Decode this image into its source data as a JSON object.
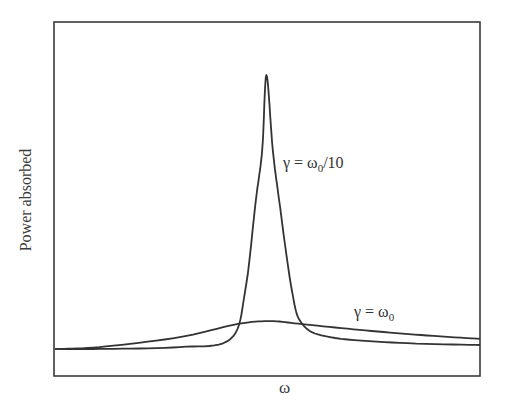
{
  "chart_data": {
    "type": "line",
    "title": "",
    "xlabel": "ω",
    "ylabel": "Power absorbed",
    "grid": false,
    "legend": "none",
    "axis_ticks": "none",
    "x_note": "ω in units of ω0, peak at ω = ω0",
    "xlim": [
      0,
      2.01
    ],
    "ylim": [
      0,
      1.0
    ],
    "series": [
      {
        "name": "γ = ω0/10",
        "annotation_text": "γ = ω",
        "annotation_sub": "0",
        "annotation_tail": "/10",
        "x": [
          0.0,
          0.21,
          0.59,
          0.83,
          0.9,
          0.95,
          0.98,
          1.0,
          1.03,
          1.06,
          1.12,
          1.17,
          1.3,
          1.63,
          2.01
        ],
        "y": [
          0.093,
          0.093,
          0.099,
          0.126,
          0.288,
          0.586,
          0.752,
          1.0,
          0.752,
          0.586,
          0.288,
          0.175,
          0.132,
          0.113,
          0.106
        ]
      },
      {
        "name": "γ = ω0",
        "annotation_text": "γ = ω",
        "annotation_sub": "0",
        "annotation_tail": "",
        "x": [
          0.0,
          0.21,
          0.59,
          0.86,
          1.02,
          1.17,
          1.44,
          1.73,
          2.01
        ],
        "y": [
          0.093,
          0.099,
          0.132,
          0.175,
          0.185,
          0.175,
          0.156,
          0.139,
          0.126
        ]
      }
    ]
  }
}
